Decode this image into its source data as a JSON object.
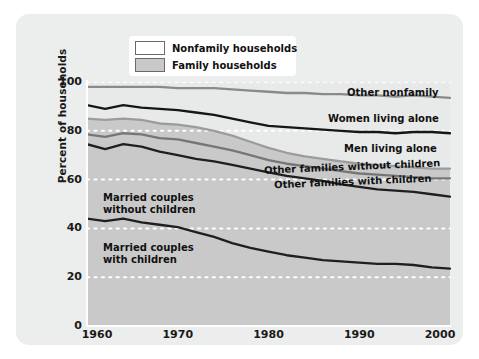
{
  "figure": {
    "background_color": "#eceded",
    "plot_fill_family": "#c9c9c9",
    "plot_fill_nonfamily": "#e8e9e9",
    "gridline_color": "#ffffff"
  },
  "legend": {
    "items": [
      {
        "label": "Nonfamily households",
        "swatch": "nonfamily",
        "color": "#ffffff"
      },
      {
        "label": "Family households",
        "swatch": "family",
        "color": "#c9c9c9"
      }
    ]
  },
  "annotations": [
    {
      "name": "other-nonfamily",
      "text": "Other nonfamily"
    },
    {
      "name": "women-living-alone",
      "text": "Women living alone"
    },
    {
      "name": "men-living-alone",
      "text": "Men living alone"
    },
    {
      "name": "other-families-without-children",
      "text": "Other families without children"
    },
    {
      "name": "other-families-with-children",
      "text": "Other families with children"
    },
    {
      "name": "married-couples-without-children-line1",
      "text": "Married couples"
    },
    {
      "name": "married-couples-without-children-line2",
      "text": "without children"
    },
    {
      "name": "married-couples-with-children-line1",
      "text": "Married couples"
    },
    {
      "name": "married-couples-with-children-line2",
      "text": "with children"
    }
  ],
  "chart_data": {
    "type": "area",
    "title": "",
    "xlabel": "",
    "ylabel": "Percent of households",
    "xlim": [
      1960,
      2000
    ],
    "ylim": [
      0,
      100
    ],
    "xticks": [
      1960,
      1970,
      1980,
      1990,
      2000
    ],
    "yticks": [
      0,
      20,
      40,
      60,
      80,
      100
    ],
    "grid": "horizontal dotted white",
    "stacked": true,
    "legend_position": "top-center",
    "x": [
      1960,
      1962,
      1964,
      1966,
      1968,
      1970,
      1972,
      1974,
      1976,
      1978,
      1980,
      1982,
      1984,
      1986,
      1988,
      1990,
      1992,
      1994,
      1996,
      1998,
      2000
    ],
    "series": [
      {
        "name": "Married couples with children",
        "group": "Family households",
        "line_color": "#1f1f1f",
        "cumulative_top": [
          44.0,
          43.0,
          44.0,
          42.5,
          41.5,
          40.5,
          38.5,
          36.5,
          34.0,
          32.0,
          30.5,
          29.0,
          28.0,
          27.0,
          26.5,
          26.0,
          25.5,
          25.5,
          25.0,
          24.0,
          23.5
        ]
      },
      {
        "name": "Married couples without children",
        "group": "Family households",
        "line_color": "#1f1f1f",
        "cumulative_top": [
          74.5,
          72.5,
          74.5,
          73.5,
          71.5,
          70.0,
          68.5,
          67.5,
          66.0,
          64.5,
          63.0,
          61.5,
          60.5,
          59.5,
          58.0,
          57.0,
          56.0,
          55.5,
          55.0,
          54.0,
          53.0
        ]
      },
      {
        "name": "Other families with children",
        "group": "Family households",
        "line_color": "#767676",
        "cumulative_top": [
          78.5,
          77.5,
          79.0,
          78.5,
          77.0,
          76.5,
          75.0,
          73.5,
          72.0,
          70.0,
          68.0,
          66.5,
          65.5,
          64.5,
          63.5,
          62.5,
          62.0,
          61.5,
          61.0,
          60.5,
          60.5
        ]
      },
      {
        "name": "Other families without children",
        "group": "Family households",
        "line_color": "#9c9c9c",
        "cumulative_top": [
          85.0,
          84.5,
          85.0,
          84.5,
          83.0,
          82.5,
          81.5,
          80.0,
          78.0,
          75.5,
          73.0,
          71.0,
          69.5,
          68.5,
          67.5,
          66.5,
          66.0,
          65.5,
          65.0,
          64.5,
          64.5
        ]
      },
      {
        "name": "Men living alone",
        "group": "Nonfamily households",
        "line_color": "#161616",
        "cumulative_top": [
          90.5,
          89.0,
          90.5,
          89.5,
          89.0,
          88.5,
          87.5,
          86.5,
          85.0,
          83.5,
          82.0,
          81.5,
          81.0,
          80.5,
          80.0,
          79.5,
          79.5,
          79.0,
          79.5,
          79.5,
          79.0
        ]
      },
      {
        "name": "Women living alone",
        "group": "Nonfamily households",
        "line_color": "#8a8a8a",
        "cumulative_top": [
          98.0,
          98.0,
          98.0,
          98.0,
          98.0,
          97.5,
          97.5,
          97.5,
          97.0,
          96.5,
          96.0,
          95.5,
          95.5,
          95.0,
          95.0,
          94.5,
          94.5,
          94.0,
          94.5,
          94.0,
          93.5
        ]
      },
      {
        "name": "Other nonfamily",
        "group": "Nonfamily households",
        "line_color": "#b0b0b0",
        "cumulative_top": [
          100,
          100,
          100,
          100,
          100,
          100,
          100,
          100,
          100,
          100,
          100,
          100,
          100,
          100,
          100,
          100,
          100,
          100,
          100,
          100,
          100
        ]
      }
    ]
  }
}
